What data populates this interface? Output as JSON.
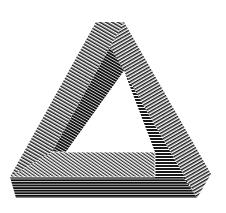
{
  "image": {
    "subject": "Penrose triangle",
    "description": "Impossible triangle rendered with line hatching",
    "width": 226,
    "height": 213
  },
  "colors": {
    "background": "#ffffff",
    "ink": "#1a1a1a",
    "gap": "#ffffff"
  },
  "faces": [
    {
      "name": "left-beam-top",
      "hatch": "diagonal"
    },
    {
      "name": "right-beam-outer",
      "hatch": "diagonal"
    },
    {
      "name": "inner-right-face",
      "hatch": "horizontal"
    },
    {
      "name": "bottom-beam-top",
      "hatch": "diagonal"
    },
    {
      "name": "bottom-beam-front",
      "hatch": "horizontal"
    },
    {
      "name": "left-inner-face",
      "hatch": "diagonal-dark"
    }
  ]
}
